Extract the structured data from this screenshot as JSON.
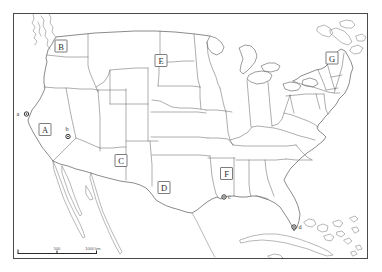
{
  "map": {
    "title_visible": false,
    "region_labels": [
      {
        "id": "A"
      },
      {
        "id": "B"
      },
      {
        "id": "C"
      },
      {
        "id": "D"
      },
      {
        "id": "E"
      },
      {
        "id": "F"
      },
      {
        "id": "G"
      }
    ],
    "point_markers": [
      {
        "id": "a"
      },
      {
        "id": "b"
      },
      {
        "id": "c"
      },
      {
        "id": "d"
      }
    ],
    "scale_bar": {
      "start_label": "0",
      "mid_label": "500",
      "end_label": "1000 km"
    },
    "colors": {
      "background": "#ffffff",
      "frame": "#4a4a4a",
      "coastline": "#4c4c4c",
      "state_border": "#6a6a6a",
      "label_text": "#2c2c2c",
      "marker": "#1f1f1f"
    }
  }
}
